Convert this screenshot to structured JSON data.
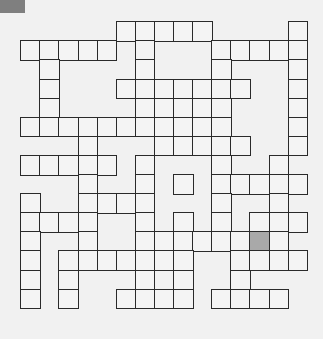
{
  "puzzle": {
    "type": "crossword",
    "rows": 15,
    "cols": 15,
    "cell_size_px": 19.1,
    "shaded_color": "#a9a9a9",
    "corner_tab_color": "#7f7f7f",
    "cells": [
      [
        0,
        [
          5,
          6,
          7,
          8,
          9,
          14
        ]
      ],
      [
        1,
        [
          0,
          1,
          2,
          3,
          4,
          6,
          10,
          11,
          12,
          13,
          14
        ]
      ],
      [
        2,
        [
          1,
          6,
          10,
          14
        ]
      ],
      [
        3,
        [
          1,
          5,
          6,
          7,
          8,
          9,
          10,
          11,
          14
        ]
      ],
      [
        4,
        [
          1,
          6,
          7,
          8,
          9,
          10,
          14
        ]
      ],
      [
        5,
        [
          0,
          1,
          2,
          3,
          4,
          5,
          6,
          7,
          8,
          9,
          10,
          14
        ]
      ],
      [
        6,
        [
          3,
          7,
          8,
          9,
          10,
          11,
          14
        ]
      ],
      [
        7,
        [
          0,
          1,
          2,
          3,
          4,
          6,
          10,
          13
        ]
      ],
      [
        8,
        [
          3,
          6,
          8,
          10,
          11,
          12,
          13,
          14
        ]
      ],
      [
        9,
        [
          0,
          3,
          4,
          5,
          6,
          10,
          13
        ]
      ],
      [
        10,
        [
          0,
          1,
          2,
          3,
          6,
          8,
          10,
          12,
          13,
          14
        ]
      ],
      [
        11,
        [
          0,
          3,
          6,
          7,
          8,
          9,
          10,
          11,
          12,
          13
        ]
      ],
      [
        12,
        [
          0,
          2,
          3,
          4,
          5,
          6,
          7,
          8,
          11,
          12,
          13,
          14
        ]
      ],
      [
        13,
        [
          0,
          2,
          6,
          8,
          11
        ]
      ],
      [
        14,
        [
          0,
          2,
          5,
          6,
          7,
          8,
          10,
          11,
          12,
          13
        ]
      ]
    ],
    "shaded": [
      [
        11,
        12
      ]
    ]
  }
}
